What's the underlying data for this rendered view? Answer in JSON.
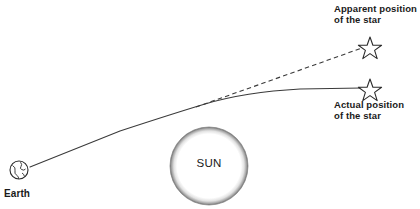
{
  "diagram": {
    "colors": {
      "ink": "#1a1a1a",
      "line": "#3a3a3a",
      "sun_rim_dark": "#8a8a8a",
      "sun_fill": "#ffffff",
      "background": "#ffffff"
    },
    "bodies": {
      "sun": {
        "label": "SUN",
        "icon": "sun-circle",
        "cx": 209,
        "cy": 166,
        "r": 39
      },
      "earth": {
        "label": "Earth",
        "icon": "earth-globe-icon",
        "cx": 19,
        "cy": 170,
        "r": 9
      }
    },
    "stars": [
      {
        "id": "apparent",
        "icon": "star-outline-icon",
        "label_line1": "Apparent position",
        "label_line2": "of the star",
        "cx": 370,
        "cy": 46
      },
      {
        "id": "actual",
        "icon": "star-outline-icon",
        "label_line1": "Actual position",
        "label_line2": "of the star",
        "cx": 370,
        "cy": 88
      }
    ],
    "paths": {
      "light_ray": {
        "name": "curved-light-ray",
        "style": "solid",
        "description": "Light path from the star bent by the Sun toward Earth"
      },
      "sight_line": {
        "name": "dashed-line-of-sight",
        "style": "dashed",
        "description": "Straight line of sight from Earth to the apparent star position"
      }
    }
  }
}
